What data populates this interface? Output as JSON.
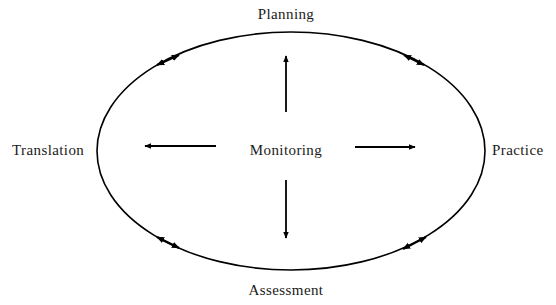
{
  "diagram": {
    "title": "",
    "center": {
      "label": "Monitoring"
    },
    "nodes": {
      "top": "Planning",
      "right": "Practice",
      "bottom": "Assessment",
      "left": "Translation"
    },
    "cycle": {
      "shape": "ellipse",
      "cx": 291,
      "cy": 151,
      "rx": 194,
      "ry": 119,
      "bidirectional_arrows": [
        "top-left",
        "top-right",
        "bottom-left",
        "bottom-right"
      ]
    },
    "radial_arrows": [
      {
        "from": "Monitoring",
        "to": "Planning",
        "direction": "up"
      },
      {
        "from": "Monitoring",
        "to": "Practice",
        "direction": "right"
      },
      {
        "from": "Monitoring",
        "to": "Assessment",
        "direction": "down"
      },
      {
        "from": "Monitoring",
        "to": "Translation",
        "direction": "left"
      }
    ],
    "colors": {
      "stroke": "#000000",
      "text": "#1a1a1a",
      "background": "#ffffff"
    }
  }
}
